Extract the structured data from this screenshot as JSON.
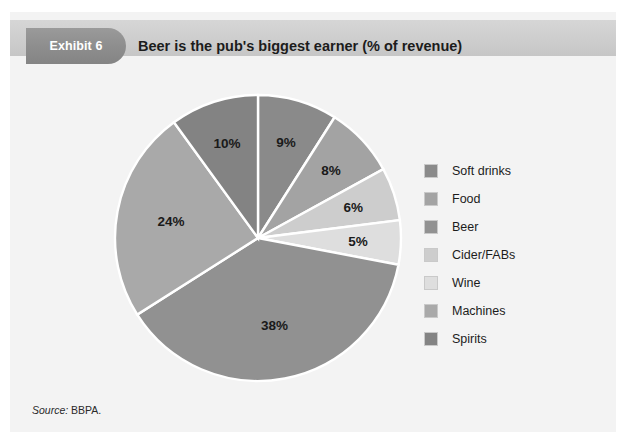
{
  "panel": {
    "background_color": "#f3f3f3",
    "header_band_color": "#cfcfcf"
  },
  "header": {
    "badge_label": "Exhibit 6",
    "badge_color": "#8e8e8e",
    "title": "Beer is the pub's biggest earner (% of revenue)"
  },
  "source": {
    "label": "Source:",
    "value": "BBPA."
  },
  "legend": {
    "items": [
      {
        "label": "Soft drinks",
        "color": "#8a8a8a"
      },
      {
        "label": "Food",
        "color": "#a3a3a3"
      },
      {
        "label": "Beer",
        "color": "#919191"
      },
      {
        "label": "Cider/FABs",
        "color": "#cdcdcd"
      },
      {
        "label": "Wine",
        "color": "#dedede"
      },
      {
        "label": "Machines",
        "color": "#a9a9a9"
      },
      {
        "label": "Spirits",
        "color": "#838383"
      }
    ]
  },
  "chart_data": {
    "type": "pie",
    "title": "Beer is the pub's biggest earner (% of revenue)",
    "unit": "%",
    "legend_position": "right",
    "start_angle_deg": 0,
    "direction": "clockwise",
    "categories": [
      "Soft drinks",
      "Food",
      "Beer",
      "Cider/FABs",
      "Wine",
      "Machines",
      "Spirits"
    ],
    "values": [
      9,
      8,
      38,
      6,
      5,
      24,
      10
    ],
    "colors": [
      "#8a8a8a",
      "#a3a3a3",
      "#919191",
      "#cdcdcd",
      "#dedede",
      "#a9a9a9",
      "#838383"
    ],
    "slices_clockwise_from_top": [
      {
        "label": "Soft drinks",
        "value": 9,
        "display": "9%",
        "color": "#8a8a8a"
      },
      {
        "label": "Food",
        "value": 8,
        "display": "8%",
        "color": "#a3a3a3"
      },
      {
        "label": "Cider/FABs",
        "value": 6,
        "display": "6%",
        "color": "#cdcdcd"
      },
      {
        "label": "Wine",
        "value": 5,
        "display": "5%",
        "color": "#dedede"
      },
      {
        "label": "Beer",
        "value": 38,
        "display": "38%",
        "color": "#919191"
      },
      {
        "label": "Machines",
        "value": 24,
        "display": "24%",
        "color": "#a9a9a9"
      },
      {
        "label": "Spirits",
        "value": 10,
        "display": "10%",
        "color": "#838383"
      }
    ],
    "data_labels": [
      "9%",
      "8%",
      "6%",
      "5%",
      "38%",
      "24%",
      "10%"
    ],
    "total": 100
  }
}
